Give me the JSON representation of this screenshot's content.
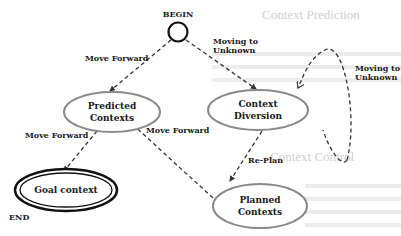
{
  "diagram": {
    "type": "state-transition",
    "start": {
      "label": "BEGIN"
    },
    "end": {
      "label": "END"
    },
    "nodes": [
      {
        "id": "predicted",
        "line1": "Predicted",
        "line2": "Contexts"
      },
      {
        "id": "diversion",
        "line1": "Context",
        "line2": "Diversion"
      },
      {
        "id": "goal",
        "line1": "Goal context",
        "line2": ""
      },
      {
        "id": "planned",
        "line1": "Planned",
        "line2": "Contexts"
      }
    ],
    "edges": [
      {
        "from": "BEGIN",
        "to": "predicted",
        "label": "Move Forward"
      },
      {
        "from": "BEGIN",
        "to": "diversion",
        "label_line1": "Moving to",
        "label_line2": "Unknown"
      },
      {
        "from": "diversion",
        "to": "diversion",
        "label_line1": "Moving to",
        "label_line2": "Unknown"
      },
      {
        "from": "predicted",
        "to": "goal",
        "label": "Move Forward"
      },
      {
        "from": "planned",
        "to": "predicted",
        "label": "Move Forward"
      },
      {
        "from": "diversion",
        "to": "planned",
        "label": "Re-Plan"
      }
    ]
  },
  "background": {
    "heading1": "Context Prediction",
    "heading2": "Context Control"
  },
  "colors": {
    "node_stroke": "#8a8a8a",
    "goal_stroke": "#111111",
    "edge": "#333333",
    "text": "#1a1a1a"
  }
}
